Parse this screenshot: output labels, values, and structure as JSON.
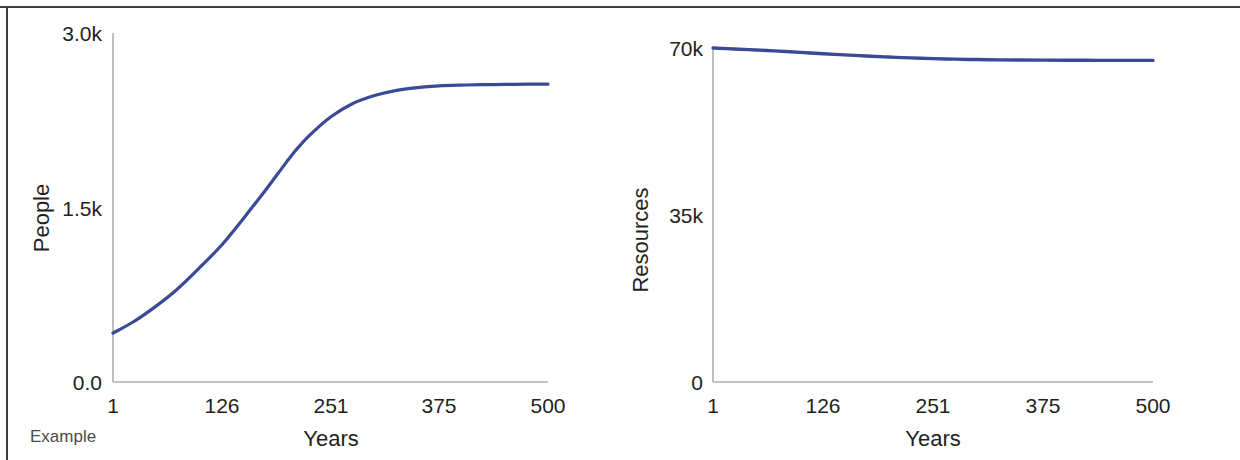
{
  "figure": {
    "caption": "Example",
    "background": "#ffffff",
    "frame_color": "#3c3c3c",
    "line_color": "#3a4a96",
    "axis_color": "#b0b0b0",
    "text_color": "#231f20"
  },
  "chart_data": [
    {
      "type": "line",
      "title": "",
      "subtitle": "",
      "xlabel": "Years",
      "ylabel": "People",
      "xlim": [
        1,
        500
      ],
      "ylim": [
        0,
        3000
      ],
      "grid": false,
      "legend": "none",
      "xticks": [
        1,
        126,
        251,
        375,
        500
      ],
      "xticklabels": [
        "1",
        "126",
        "251",
        "375",
        "500"
      ],
      "yticks": [
        0,
        1500,
        3000
      ],
      "yticklabels": [
        "0.0",
        "1.5k",
        "3.0k"
      ],
      "annotations": [
        "Example"
      ],
      "series": [
        {
          "name": "People",
          "color": "#3a4a96",
          "x": [
            1,
            25,
            50,
            75,
            100,
            126,
            150,
            175,
            190,
            200,
            210,
            225,
            251,
            275,
            300,
            325,
            350,
            375,
            400,
            425,
            450,
            475,
            500
          ],
          "values": [
            420,
            520,
            650,
            800,
            980,
            1180,
            1400,
            1640,
            1790,
            1890,
            1985,
            2110,
            2280,
            2390,
            2460,
            2505,
            2530,
            2545,
            2552,
            2556,
            2558,
            2560,
            2560
          ]
        }
      ]
    },
    {
      "type": "line",
      "title": "",
      "subtitle": "",
      "xlabel": "Years",
      "ylabel": "Resources",
      "xlim": [
        1,
        500
      ],
      "ylim": [
        0,
        70000
      ],
      "grid": false,
      "legend": "none",
      "xticks": [
        1,
        126,
        251,
        375,
        500
      ],
      "xticklabels": [
        "1",
        "126",
        "251",
        "375",
        "500"
      ],
      "yticks": [
        0,
        35000,
        70000
      ],
      "yticklabels": [
        "0",
        "35k",
        "70k"
      ],
      "annotations": [],
      "series": [
        {
          "name": "Resources",
          "color": "#3a4a96",
          "x": [
            1,
            25,
            50,
            75,
            100,
            126,
            150,
            175,
            200,
            225,
            251,
            275,
            300,
            325,
            350,
            375,
            400,
            425,
            450,
            475,
            500
          ],
          "values": [
            70000,
            69800,
            69580,
            69340,
            69080,
            68810,
            68560,
            68320,
            68100,
            67920,
            67770,
            67660,
            67580,
            67520,
            67480,
            67450,
            67430,
            67420,
            67410,
            67405,
            67400
          ]
        }
      ]
    }
  ]
}
